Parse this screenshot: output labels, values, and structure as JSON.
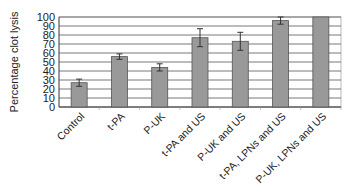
{
  "chart_data": {
    "type": "bar",
    "title": "",
    "xlabel": "",
    "ylabel": "Percentage clot lysis",
    "ylim": [
      0,
      100
    ],
    "yticks": [
      0,
      10,
      20,
      30,
      40,
      50,
      60,
      70,
      80,
      90,
      100
    ],
    "grid": true,
    "legend": null,
    "categories": [
      "Control",
      "t-PA",
      "P-UK",
      "t-PA and US",
      "P-UK and US",
      "t-PA, LPNs and US",
      "P-UK, LPNs and US"
    ],
    "values": [
      27,
      56,
      44,
      77,
      73,
      96,
      100
    ],
    "error": [
      4,
      3,
      4,
      10,
      10,
      4,
      0
    ],
    "colors": {
      "bar": "#999999",
      "bar_edge": "#555555",
      "grid": "#555555",
      "plot_bg": "#ffffff"
    }
  }
}
